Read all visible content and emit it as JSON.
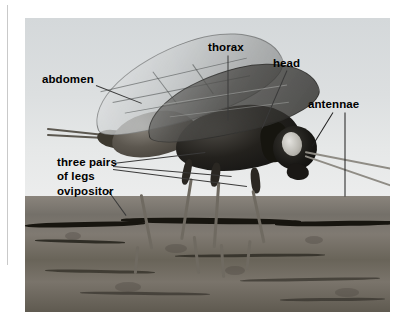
{
  "figure": {
    "type": "labeled-photograph",
    "photo_frame": {
      "x": 25,
      "y": 18,
      "width": 365,
      "height": 294
    },
    "background": "#ffffff",
    "colors": {
      "sky": "#dcdfe0",
      "bark": "#746f67",
      "bark_crack": "#17150f",
      "label_text": "#000000",
      "leader_line": "#3a3a3a",
      "margin_rule": "#c9c9c9"
    }
  },
  "labels": [
    {
      "id": "abdomen",
      "text": "abdomen",
      "x": 42,
      "y": 73,
      "align": "left"
    },
    {
      "id": "thorax",
      "text": "thorax",
      "x": 208,
      "y": 41,
      "align": "left"
    },
    {
      "id": "head",
      "text": "head",
      "x": 273,
      "y": 57,
      "align": "left"
    },
    {
      "id": "antennae",
      "text": "antennae",
      "x": 308,
      "y": 98,
      "align": "left"
    },
    {
      "id": "legs",
      "text": "three pairs\nof legs",
      "x": 57,
      "y": 156,
      "align": "left"
    },
    {
      "id": "ovipositor",
      "text": "ovipositor",
      "x": 57,
      "y": 185,
      "align": "left"
    }
  ],
  "leader_lines": [
    {
      "from": "thorax",
      "x1": 228,
      "y1": 55,
      "x2": 228,
      "y2": 120
    },
    {
      "from": "head",
      "x1": 287,
      "y1": 70,
      "x2": 262,
      "y2": 128
    },
    {
      "from": "abdomen",
      "x1": 96,
      "y1": 85,
      "x2": 142,
      "y2": 103
    },
    {
      "from": "antennae",
      "x1": 333,
      "y1": 112,
      "x2": 312,
      "y2": 146
    },
    {
      "from": "antennae",
      "x1": 345,
      "y1": 112,
      "x2": 345,
      "y2": 196
    },
    {
      "from": "legs",
      "x1": 113,
      "y1": 163,
      "x2": 205,
      "y2": 152
    },
    {
      "from": "legs",
      "x1": 113,
      "y1": 166,
      "x2": 232,
      "y2": 176
    },
    {
      "from": "legs",
      "x1": 113,
      "y1": 169,
      "x2": 247,
      "y2": 186
    },
    {
      "from": "ovipositor",
      "x1": 108,
      "y1": 190,
      "x2": 126,
      "y2": 215
    }
  ],
  "anatomy_parts": [
    "abdomen",
    "thorax",
    "head",
    "antennae",
    "three pairs of legs",
    "ovipositor"
  ]
}
